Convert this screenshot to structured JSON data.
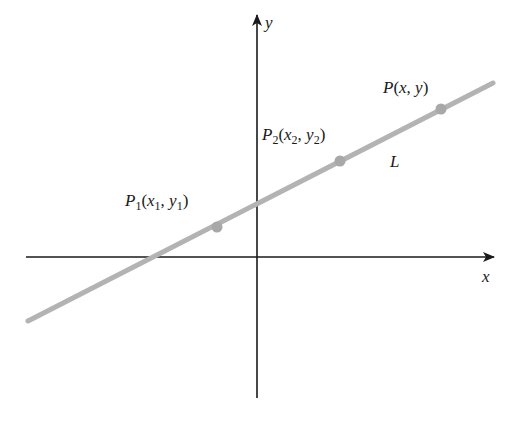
{
  "diagram": {
    "axes": {
      "x_label": "x",
      "y_label": "y",
      "origin_px": [
        257,
        257
      ],
      "x_range_px": [
        26,
        495
      ],
      "y_range_px": [
        14,
        398
      ],
      "color": "#1a1a1a"
    },
    "line": {
      "label": "L",
      "start_px": [
        28,
        321
      ],
      "end_px": [
        493,
        83
      ],
      "color": "#b3b3b3"
    },
    "points": [
      {
        "name": "P1",
        "label_main": "P",
        "label_sub": "1",
        "coords": "(x1, y1)",
        "px": [
          217,
          227
        ]
      },
      {
        "name": "P2",
        "label_main": "P",
        "label_sub": "2",
        "coords": "(x2, y2)",
        "px": [
          340,
          161
        ]
      },
      {
        "name": "P",
        "label_main": "P",
        "label_sub": "",
        "coords": "(x, y)",
        "px": [
          441,
          109
        ]
      }
    ],
    "labels": {
      "p1": {
        "P": "P",
        "s1": "1",
        "open": "(",
        "x": "x",
        "xs": "1",
        "comma": ", ",
        "y": "y",
        "ys": "1",
        "close": ")"
      },
      "p2": {
        "P": "P",
        "s1": "2",
        "open": "(",
        "x": "x",
        "xs": "2",
        "comma": ", ",
        "y": "y",
        "ys": "2",
        "close": ")"
      },
      "p": {
        "P": "P",
        "open": "(",
        "x": "x",
        "comma": ", ",
        "y": "y",
        "close": ")"
      },
      "L": "L",
      "x_axis": "x",
      "y_axis": "y"
    }
  }
}
